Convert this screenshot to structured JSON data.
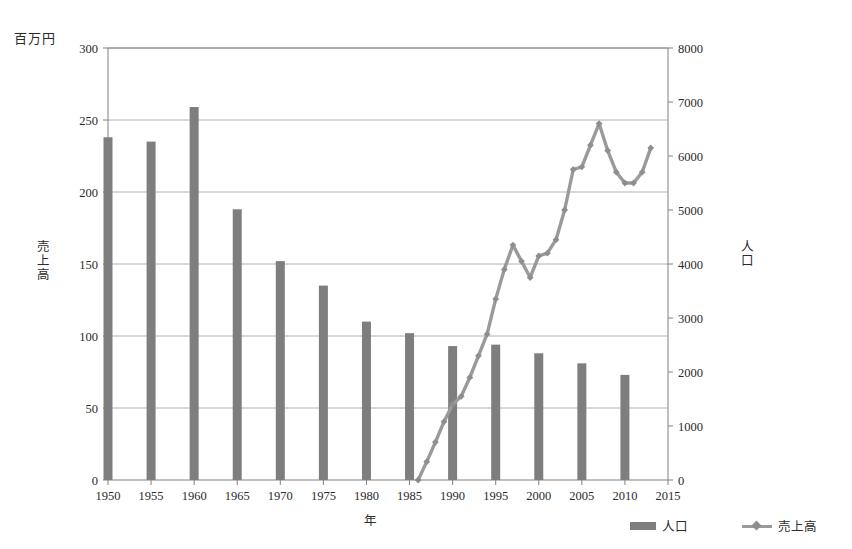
{
  "labels": {
    "unit_label": "百万円",
    "left_axis_title": "売上高",
    "right_axis_title": "人口",
    "x_axis_title": "年"
  },
  "legend": {
    "bar_label": "人口",
    "line_label": "売上高"
  },
  "colors": {
    "bar": "#7e7e7e",
    "line": "#9a9a9a",
    "marker": "#8e8e8e",
    "grid": "#b0b0b0",
    "axis": "#808080",
    "text": "#2b2b2b"
  },
  "chart_data": {
    "type": "bar",
    "title": "",
    "xlabel": "年",
    "ylabel": "売上高",
    "y2label": "人口",
    "unit_note": "百万円",
    "xlim": [
      1950,
      2015
    ],
    "xticks": [
      1950,
      1955,
      1960,
      1965,
      1970,
      1975,
      1980,
      1985,
      1990,
      1995,
      2000,
      2005,
      2010,
      2015
    ],
    "ylim": [
      0,
      300
    ],
    "yticks": [
      0,
      50,
      100,
      150,
      200,
      250,
      300
    ],
    "y2lim": [
      0,
      8000
    ],
    "y2ticks": [
      0,
      1000,
      2000,
      3000,
      4000,
      5000,
      6000,
      7000,
      8000
    ],
    "grid": true,
    "legend_position": "bottom-right",
    "series": [
      {
        "name": "人口",
        "type": "bar",
        "axis": "left",
        "x": [
          1950,
          1955,
          1960,
          1965,
          1970,
          1975,
          1980,
          1985,
          1990,
          1995,
          2000,
          2005,
          2010
        ],
        "values": [
          238,
          235,
          259,
          188,
          152,
          135,
          110,
          102,
          93,
          94,
          88,
          81,
          73
        ]
      },
      {
        "name": "売上高",
        "type": "line",
        "axis": "right",
        "marker": "diamond",
        "x": [
          1986,
          1987,
          1988,
          1989,
          1990,
          1991,
          1992,
          1993,
          1994,
          1995,
          1996,
          1997,
          1998,
          1999,
          2000,
          2001,
          2002,
          2003,
          2004,
          2005,
          2006,
          2007,
          2008,
          2009,
          2010,
          2011,
          2012,
          2013
        ],
        "values": [
          0,
          340,
          700,
          1080,
          1400,
          1550,
          1900,
          2300,
          2700,
          3350,
          3900,
          4350,
          4050,
          3750,
          4150,
          4200,
          4450,
          5000,
          5750,
          5800,
          6200,
          6600,
          6100,
          5700,
          5500,
          5500,
          5700,
          6150
        ]
      }
    ]
  }
}
